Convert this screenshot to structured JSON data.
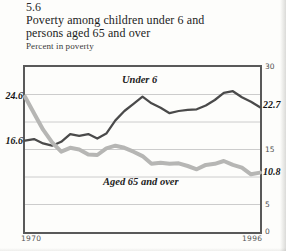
{
  "header": {
    "figure_number": "5.6",
    "title_lines": [
      "Poverty among children under 6 and",
      "persons aged 65 and over"
    ],
    "subtitle": "Percent in poverty"
  },
  "colors": {
    "under6_line": "#4a4a4a",
    "aged65_line": "#b6b6b4",
    "gridline": "#cccccc",
    "plot_border": "#595959",
    "title_text": "#1c1c1c",
    "tick_text": "#4e4e4e",
    "value_label_text": "#161616"
  },
  "chart_data": {
    "type": "line",
    "title": "Poverty among children under 6 and persons aged 65 and over",
    "ylabel": "Percent in poverty",
    "xlabel": "",
    "ylim": [
      0,
      30
    ],
    "x_range": [
      1970,
      1996
    ],
    "grid": true,
    "gridline_values": [
      5,
      10,
      15,
      20,
      25
    ],
    "legend_position": "inline-labels",
    "yticks": [
      {
        "value": 30,
        "label": "30"
      },
      {
        "value": 15,
        "label": "15"
      },
      {
        "value": 5,
        "label": "5"
      },
      {
        "value": 0,
        "label": "0"
      }
    ],
    "xticks": [
      {
        "value": 1970,
        "label": "1970"
      },
      {
        "value": 1996,
        "label": "1996"
      }
    ],
    "x": [
      1970,
      1971,
      1972,
      1973,
      1974,
      1975,
      1976,
      1977,
      1978,
      1979,
      1980,
      1981,
      1982,
      1983,
      1984,
      1985,
      1986,
      1987,
      1988,
      1989,
      1990,
      1991,
      1992,
      1993,
      1994,
      1995,
      1996
    ],
    "series": [
      {
        "name": "Under 6",
        "label": "Under 6",
        "color": "#4a4a4a",
        "stroke_width": 2.25,
        "start_label": "16.6",
        "end_label": "22.7",
        "values": [
          16.6,
          16.9,
          16.1,
          15.7,
          16.4,
          17.8,
          17.5,
          17.8,
          17.0,
          17.9,
          20.3,
          22.0,
          23.3,
          24.6,
          23.4,
          22.6,
          21.6,
          22.0,
          22.2,
          22.3,
          23.0,
          24.0,
          25.3,
          25.6,
          24.5,
          23.7,
          22.7
        ]
      },
      {
        "name": "Aged 65 and over",
        "label": "Aged 65 and over",
        "color": "#b6b6b4",
        "stroke_width": 4,
        "start_label": "24.6",
        "end_label": "10.8",
        "values": [
          24.6,
          21.6,
          18.6,
          16.3,
          14.6,
          15.3,
          15.0,
          14.1,
          14.0,
          15.2,
          15.7,
          15.3,
          14.6,
          13.8,
          12.4,
          12.6,
          12.4,
          12.5,
          12.0,
          11.4,
          12.2,
          12.4,
          12.9,
          12.2,
          11.7,
          10.5,
          10.8
        ]
      }
    ]
  }
}
